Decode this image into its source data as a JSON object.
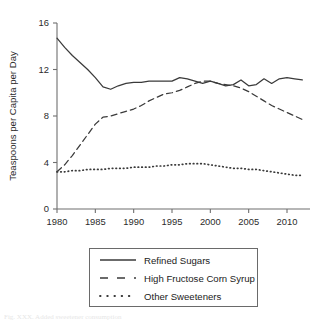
{
  "figure": {
    "caption_partial": "Fig. XXX. Added sweetener consumption"
  },
  "legend": {
    "entries": [
      {
        "label": "Refined Sugars",
        "style": "solid",
        "swatch_name": "legend-swatch-solid"
      },
      {
        "label": "High Fructose Corn Syrup",
        "style": "dashed",
        "swatch_name": "legend-swatch-dashed"
      },
      {
        "label": "Other Sweeteners",
        "style": "dotted",
        "swatch_name": "legend-swatch-dotted"
      }
    ]
  },
  "chart_data": {
    "type": "line",
    "title": "",
    "subtitle": "",
    "xlabel": "",
    "ylabel": "Teaspoons per Capita per Day",
    "xlim": [
      1980,
      2013
    ],
    "ylim": [
      0,
      16
    ],
    "xticks": [
      1980,
      1985,
      1990,
      1995,
      2000,
      2005,
      2010
    ],
    "xticklabels": [
      "1980",
      "1985",
      "1990",
      "1995",
      "2000",
      "2005",
      "2010"
    ],
    "yticks": [
      0,
      4,
      8,
      12,
      16
    ],
    "yticklabels": [
      "0",
      "4",
      "8",
      "12",
      "16"
    ],
    "grid": false,
    "legend_position": "below-plot",
    "x": [
      1980,
      1981,
      1982,
      1983,
      1984,
      1985,
      1986,
      1987,
      1988,
      1989,
      1990,
      1991,
      1992,
      1993,
      1994,
      1995,
      1996,
      1997,
      1998,
      1999,
      2000,
      2001,
      2002,
      2003,
      2004,
      2005,
      2006,
      2007,
      2008,
      2009,
      2010,
      2011,
      2012
    ],
    "series": [
      {
        "name": "Refined Sugars",
        "linestyle": "solid",
        "color": "#3a3a3a",
        "values": [
          14.7,
          13.9,
          13.2,
          12.6,
          12.0,
          11.3,
          10.5,
          10.3,
          10.6,
          10.8,
          10.9,
          10.9,
          11.0,
          11.0,
          11.0,
          11.0,
          11.3,
          11.2,
          11.0,
          10.8,
          11.0,
          10.8,
          10.6,
          10.7,
          11.1,
          10.6,
          10.7,
          11.2,
          10.8,
          11.2,
          11.3,
          11.2,
          11.1
        ]
      },
      {
        "name": "High Fructose Corn Syrup",
        "linestyle": "dashed",
        "color": "#3a3a3a",
        "values": [
          3.2,
          3.8,
          4.6,
          5.5,
          6.4,
          7.3,
          7.9,
          8.0,
          8.2,
          8.4,
          8.6,
          8.9,
          9.3,
          9.6,
          9.9,
          10.0,
          10.2,
          10.5,
          10.8,
          11.0,
          11.0,
          10.8,
          10.7,
          10.6,
          10.4,
          10.1,
          9.7,
          9.3,
          8.9,
          8.6,
          8.3,
          8.0,
          7.7
        ]
      },
      {
        "name": "Other Sweeteners",
        "linestyle": "dotted",
        "color": "#3a3a3a",
        "values": [
          3.2,
          3.2,
          3.3,
          3.3,
          3.4,
          3.4,
          3.4,
          3.5,
          3.5,
          3.5,
          3.6,
          3.6,
          3.6,
          3.7,
          3.7,
          3.8,
          3.8,
          3.9,
          3.9,
          3.9,
          3.8,
          3.7,
          3.6,
          3.5,
          3.5,
          3.4,
          3.4,
          3.3,
          3.2,
          3.1,
          3.0,
          2.9,
          2.9
        ]
      }
    ]
  }
}
